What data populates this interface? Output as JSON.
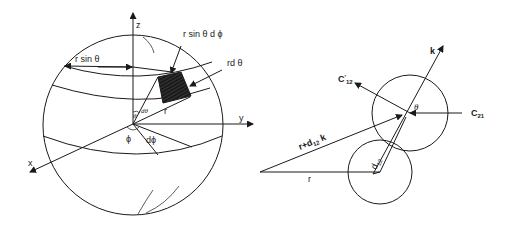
{
  "figure": {
    "left_panel": {
      "name": "spherical-coordinates-volume-element",
      "axes": {
        "z": "z",
        "y": "y",
        "x": "x"
      },
      "labels": {
        "r_sin_theta": "r sin θ",
        "r_sin_theta_dphi": "r sin θ d ϕ",
        "r_dtheta": "rd θ",
        "r": "r",
        "theta": "θ",
        "dtheta": "dθ",
        "phi": "ϕ",
        "dphi": "dϕ"
      }
    },
    "right_panel": {
      "name": "binary-collision-geometry",
      "labels": {
        "k": "k",
        "c12_prime": "C",
        "c12_prime_sub": "12",
        "c12_prime_mark": "′",
        "c21": "C",
        "c21_sub": "21",
        "theta": "θ",
        "r_plus": "r+d",
        "r_plus_sub": "12",
        "r_plus_k": " k",
        "r": "r",
        "d12": "d",
        "d12_sub": "12"
      }
    }
  }
}
